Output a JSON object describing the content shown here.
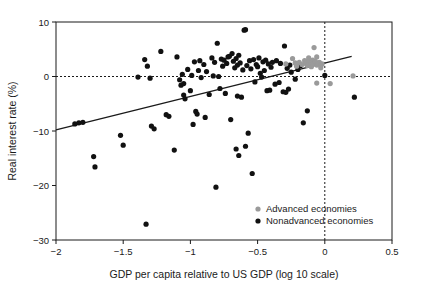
{
  "chart_data": {
    "type": "scatter",
    "title": "",
    "xlabel": "GDP per capita relative to US GDP (log 10 scale)",
    "ylabel": "Real interest rate (%)",
    "xlim": [
      -2,
      0.5
    ],
    "ylim": [
      -30,
      10
    ],
    "xticks": [
      -2,
      -1.5,
      -1,
      -0.5,
      0,
      0.5
    ],
    "xtick_labels": [
      "−2",
      "−1.5",
      "−1",
      "−0.5",
      "0",
      "0.5"
    ],
    "yticks": [
      -30,
      -20,
      -10,
      0,
      10
    ],
    "ytick_labels": [
      "−30",
      "−20",
      "−10",
      "0",
      "10"
    ],
    "grid": false,
    "reference_lines": [
      {
        "name": "zero-interest-rate-line",
        "axis": "y",
        "value": 0,
        "style": "dotted"
      },
      {
        "name": "us-gdp-parity-line",
        "axis": "x",
        "value": 0,
        "style": "dotted"
      }
    ],
    "trendline": {
      "name": "regression-line",
      "x": [
        -2,
        0.2
      ],
      "y": [
        -9.8,
        3.7
      ],
      "color": "#1a1a1a"
    },
    "legend": {
      "position": "bottom-right",
      "entries": [
        {
          "label": "Advanced economies",
          "color": "#9a9a9a",
          "marker": "circle"
        },
        {
          "label": "Nonadvanced economies",
          "color": "#111111",
          "marker": "circle"
        }
      ]
    },
    "series": [
      {
        "name": "Advanced economies",
        "color": "#9a9a9a",
        "points": [
          [
            -0.29,
            2.3
          ],
          [
            -0.24,
            3.3
          ],
          [
            -0.22,
            2.5
          ],
          [
            -0.21,
            1.9
          ],
          [
            -0.19,
            2.6
          ],
          [
            -0.17,
            2.2
          ],
          [
            -0.15,
            2.9
          ],
          [
            -0.14,
            2.4
          ],
          [
            -0.13,
            2.0
          ],
          [
            -0.12,
            2.7
          ],
          [
            -0.12,
            3.4
          ],
          [
            -0.11,
            2.2
          ],
          [
            -0.1,
            2.6
          ],
          [
            -0.1,
            1.8
          ],
          [
            -0.09,
            3.0
          ],
          [
            -0.09,
            2.3
          ],
          [
            -0.08,
            2.5
          ],
          [
            -0.08,
            5.3
          ],
          [
            -0.07,
            2.8
          ],
          [
            -0.06,
            2.1
          ],
          [
            -0.06,
            3.6
          ],
          [
            -0.05,
            2.4
          ],
          [
            -0.04,
            2.6
          ],
          [
            -0.03,
            2.0
          ],
          [
            -0.03,
            1.6
          ],
          [
            -0.02,
            2.3
          ],
          [
            -0.06,
            -1.2
          ],
          [
            0.04,
            -1.3
          ],
          [
            0.21,
            0.1
          ]
        ]
      },
      {
        "name": "Nonadvanced economies",
        "color": "#111111",
        "points": [
          [
            -1.86,
            -8.7
          ],
          [
            -1.83,
            -8.5
          ],
          [
            -1.8,
            -8.4
          ],
          [
            -1.72,
            -14.7
          ],
          [
            -1.71,
            -16.6
          ],
          [
            -1.52,
            -10.8
          ],
          [
            -1.5,
            -12.6
          ],
          [
            -1.39,
            -0.1
          ],
          [
            -1.34,
            3.1
          ],
          [
            -1.33,
            -27.1
          ],
          [
            -1.32,
            1.9
          ],
          [
            -1.3,
            -0.3
          ],
          [
            -1.29,
            -9.1
          ],
          [
            -1.27,
            -9.6
          ],
          [
            -1.22,
            4.6
          ],
          [
            -1.18,
            -7.0
          ],
          [
            -1.16,
            -7.3
          ],
          [
            -1.12,
            -13.5
          ],
          [
            -1.1,
            3.6
          ],
          [
            -1.08,
            -0.6
          ],
          [
            -1.07,
            -1.6
          ],
          [
            -1.06,
            0.4
          ],
          [
            -1.05,
            -3.4
          ],
          [
            -1.05,
            -1.3
          ],
          [
            -1.04,
            -4.1
          ],
          [
            -1.02,
            1.3
          ],
          [
            -1.0,
            -2.6
          ],
          [
            -0.99,
            0.2
          ],
          [
            -0.98,
            -8.8
          ],
          [
            -0.97,
            2.7
          ],
          [
            -0.96,
            -6.4
          ],
          [
            -0.95,
            -6.9
          ],
          [
            -0.94,
            1.1
          ],
          [
            -0.93,
            2.9
          ],
          [
            -0.92,
            -0.2
          ],
          [
            -0.9,
            2.2
          ],
          [
            -0.89,
            -7.5
          ],
          [
            -0.88,
            0.9
          ],
          [
            -0.86,
            -3.3
          ],
          [
            -0.84,
            3.4
          ],
          [
            -0.83,
            0.1
          ],
          [
            -0.82,
            2.6
          ],
          [
            -0.81,
            -20.3
          ],
          [
            -0.8,
            6.1
          ],
          [
            -0.79,
            0.0
          ],
          [
            -0.78,
            -2.2
          ],
          [
            -0.77,
            3.2
          ],
          [
            -0.76,
            1.9
          ],
          [
            -0.75,
            3.0
          ],
          [
            -0.74,
            -3.1
          ],
          [
            -0.73,
            2.4
          ],
          [
            -0.72,
            3.6
          ],
          [
            -0.71,
            3.7
          ],
          [
            -0.7,
            -7.9
          ],
          [
            -0.69,
            4.2
          ],
          [
            -0.68,
            2.8
          ],
          [
            -0.67,
            1.6
          ],
          [
            -0.66,
            -13.3
          ],
          [
            -0.66,
            3.3
          ],
          [
            -0.65,
            2.1
          ],
          [
            -0.65,
            -3.6
          ],
          [
            -0.64,
            -14.5
          ],
          [
            -0.64,
            3.9
          ],
          [
            -0.63,
            2.5
          ],
          [
            -0.62,
            -3.8
          ],
          [
            -0.61,
            1.2
          ],
          [
            -0.6,
            8.5
          ],
          [
            -0.59,
            8.6
          ],
          [
            -0.59,
            -12.8
          ],
          [
            -0.58,
            2.0
          ],
          [
            -0.57,
            -10.4
          ],
          [
            -0.56,
            2.9
          ],
          [
            -0.55,
            1.4
          ],
          [
            -0.54,
            -17.8
          ],
          [
            -0.53,
            3.1
          ],
          [
            -0.52,
            -1.0
          ],
          [
            -0.51,
            2.2
          ],
          [
            -0.5,
            1.8
          ],
          [
            -0.49,
            3.4
          ],
          [
            -0.48,
            0.6
          ],
          [
            -0.47,
            -0.1
          ],
          [
            -0.46,
            2.7
          ],
          [
            -0.45,
            1.1
          ],
          [
            -0.44,
            3.0
          ],
          [
            -0.43,
            -2.6
          ],
          [
            -0.42,
            2.3
          ],
          [
            -0.41,
            -2.5
          ],
          [
            -0.4,
            1.7
          ],
          [
            -0.39,
            2.6
          ],
          [
            -0.37,
            -1.4
          ],
          [
            -0.36,
            2.9
          ],
          [
            -0.34,
            -1.1
          ],
          [
            -0.33,
            2.4
          ],
          [
            -0.31,
            -2.8
          ],
          [
            -0.3,
            5.6
          ],
          [
            -0.29,
            -2.9
          ],
          [
            -0.28,
            1.5
          ],
          [
            -0.27,
            -2.3
          ],
          [
            -0.26,
            2.1
          ],
          [
            -0.25,
            0.8
          ],
          [
            -0.22,
            -0.5
          ],
          [
            -0.2,
            1.3
          ],
          [
            -0.18,
            2.0
          ],
          [
            -0.16,
            -8.5
          ],
          [
            -0.13,
            -6.3
          ],
          [
            0.0,
            0.2
          ],
          [
            0.22,
            -3.8
          ]
        ]
      }
    ]
  }
}
